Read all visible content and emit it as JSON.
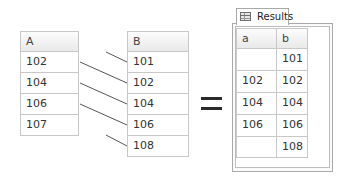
{
  "diagram": {
    "type": "full-outer-join-illustration",
    "table_a": {
      "header": "A",
      "rows": [
        "102",
        "104",
        "106",
        "107"
      ]
    },
    "table_b": {
      "header": "B",
      "rows": [
        "101",
        "102",
        "104",
        "106",
        "108"
      ]
    },
    "operator": "=",
    "results": {
      "tab_label": "Results",
      "tab_icon": "grid-icon",
      "columns": [
        "a",
        "b"
      ],
      "rows": [
        [
          "",
          "101"
        ],
        [
          "102",
          "102"
        ],
        [
          "104",
          "104"
        ],
        [
          "106",
          "106"
        ],
        [
          "",
          "108"
        ]
      ]
    },
    "connectors": [
      {
        "from": "",
        "to": "101"
      },
      {
        "from": "102",
        "to": "102"
      },
      {
        "from": "104",
        "to": "104"
      },
      {
        "from": "106",
        "to": "106"
      },
      {
        "from": "",
        "to": "108"
      }
    ],
    "colors": {
      "border": "#c8c8c8",
      "header_bg": "#ececec",
      "line": "#555555",
      "equals": "#2a2a2a"
    }
  }
}
